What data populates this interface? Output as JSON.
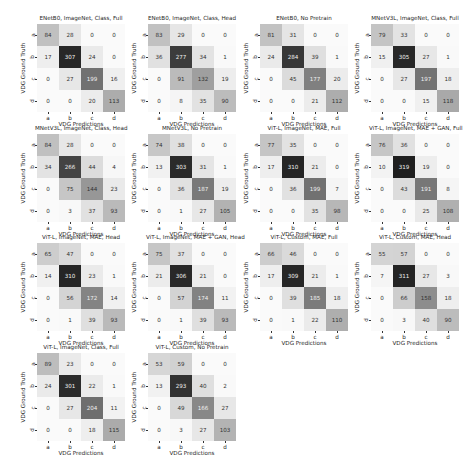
{
  "chart_data": [
    {
      "type": "heatmap",
      "title": "ENetB0, ImageNet, Class, Full",
      "xlabel": "VDG Predictions",
      "ylabel": "VDG Ground Truth",
      "x_ticks": [
        "a",
        "b",
        "c",
        "d"
      ],
      "y_ticks": [
        "a",
        "b",
        "c",
        "d"
      ],
      "matrix": [
        [
          84,
          28,
          0,
          0
        ],
        [
          17,
          307,
          24,
          0
        ],
        [
          0,
          27,
          199,
          16
        ],
        [
          0,
          0,
          20,
          113
        ]
      ]
    },
    {
      "type": "heatmap",
      "title": "ENetB0, ImageNet, Class, Head",
      "xlabel": "VDG Predictions",
      "ylabel": "VDG Ground Truth",
      "x_ticks": [
        "a",
        "b",
        "c",
        "d"
      ],
      "y_ticks": [
        "a",
        "b",
        "c",
        "d"
      ],
      "matrix": [
        [
          83,
          29,
          0,
          0
        ],
        [
          36,
          277,
          34,
          1
        ],
        [
          0,
          91,
          132,
          19
        ],
        [
          0,
          8,
          35,
          90
        ]
      ]
    },
    {
      "type": "heatmap",
      "title": "ENetB0, No Pretrain",
      "xlabel": "VDG Predictions",
      "ylabel": "VDG Ground Truth",
      "x_ticks": [
        "a",
        "b",
        "c",
        "d"
      ],
      "y_ticks": [
        "a",
        "b",
        "c",
        "d"
      ],
      "matrix": [
        [
          81,
          31,
          0,
          0
        ],
        [
          24,
          284,
          39,
          1
        ],
        [
          0,
          45,
          177,
          20
        ],
        [
          0,
          0,
          21,
          112
        ]
      ]
    },
    {
      "type": "heatmap",
      "title": "MNetV3L, ImageNet, Class, Full",
      "xlabel": "VDG Predictions",
      "ylabel": "VDG Ground Truth",
      "x_ticks": [
        "a",
        "b",
        "c",
        "d"
      ],
      "y_ticks": [
        "a",
        "b",
        "c",
        "d"
      ],
      "matrix": [
        [
          79,
          33,
          0,
          0
        ],
        [
          15,
          305,
          27,
          1
        ],
        [
          0,
          27,
          197,
          18
        ],
        [
          0,
          0,
          15,
          118
        ]
      ]
    },
    {
      "type": "heatmap",
      "title": "MNetV3L, ImageNet, Class, Head",
      "xlabel": "VDG Predictions",
      "ylabel": "VDG Ground Truth",
      "x_ticks": [
        "a",
        "b",
        "c",
        "d"
      ],
      "y_ticks": [
        "a",
        "b",
        "c",
        "d"
      ],
      "matrix": [
        [
          84,
          28,
          0,
          0
        ],
        [
          34,
          266,
          44,
          4
        ],
        [
          0,
          75,
          144,
          23
        ],
        [
          0,
          3,
          37,
          93
        ]
      ]
    },
    {
      "type": "heatmap",
      "title": "MNetV3L, No Pretrain",
      "xlabel": "VDG Predictions",
      "ylabel": "VDG Ground Truth",
      "x_ticks": [
        "a",
        "b",
        "c",
        "d"
      ],
      "y_ticks": [
        "a",
        "b",
        "c",
        "d"
      ],
      "matrix": [
        [
          74,
          38,
          0,
          0
        ],
        [
          13,
          303,
          31,
          1
        ],
        [
          0,
          36,
          187,
          19
        ],
        [
          0,
          1,
          27,
          105
        ]
      ]
    },
    {
      "type": "heatmap",
      "title": "ViT-L, ImageNet, MAE, Full",
      "xlabel": "VDG Predictions",
      "ylabel": "VDG Ground Truth",
      "x_ticks": [
        "a",
        "b",
        "c",
        "d"
      ],
      "y_ticks": [
        "a",
        "b",
        "c",
        "d"
      ],
      "matrix": [
        [
          77,
          35,
          0,
          0
        ],
        [
          17,
          310,
          21,
          0
        ],
        [
          0,
          36,
          199,
          7
        ],
        [
          0,
          0,
          35,
          98
        ]
      ]
    },
    {
      "type": "heatmap",
      "title": "ViT-L, ImageNet, MAE + GAN, Full",
      "xlabel": "VDG Predictions",
      "ylabel": "VDG Ground Truth",
      "x_ticks": [
        "a",
        "b",
        "c",
        "d"
      ],
      "y_ticks": [
        "a",
        "b",
        "c",
        "d"
      ],
      "matrix": [
        [
          76,
          36,
          0,
          0
        ],
        [
          10,
          319,
          19,
          0
        ],
        [
          0,
          43,
          191,
          8
        ],
        [
          0,
          0,
          25,
          108
        ]
      ]
    },
    {
      "type": "heatmap",
      "title": "ViT-L, ImageNet, MAE, Head",
      "xlabel": "VDG Predictions",
      "ylabel": "VDG Ground Truth",
      "x_ticks": [
        "a",
        "b",
        "c",
        "d"
      ],
      "y_ticks": [
        "a",
        "b",
        "c",
        "d"
      ],
      "matrix": [
        [
          65,
          47,
          0,
          0
        ],
        [
          14,
          310,
          23,
          1
        ],
        [
          0,
          56,
          172,
          14
        ],
        [
          0,
          1,
          39,
          93
        ]
      ]
    },
    {
      "type": "heatmap",
      "title": "ViT-L, ImageNet, MAE + GAN, Head",
      "xlabel": "VDG Predictions",
      "ylabel": "VDG Ground Truth",
      "x_ticks": [
        "a",
        "b",
        "c",
        "d"
      ],
      "y_ticks": [
        "a",
        "b",
        "c",
        "d"
      ],
      "matrix": [
        [
          75,
          37,
          0,
          0
        ],
        [
          21,
          306,
          21,
          0
        ],
        [
          0,
          57,
          174,
          11
        ],
        [
          0,
          1,
          39,
          93
        ]
      ]
    },
    {
      "type": "heatmap",
      "title": "ViT-L, Custom, MAE, Full",
      "xlabel": "VDG Predictions",
      "ylabel": "VDG Ground Truth",
      "x_ticks": [
        "a",
        "b",
        "c",
        "d"
      ],
      "y_ticks": [
        "a",
        "b",
        "c",
        "d"
      ],
      "matrix": [
        [
          66,
          46,
          0,
          0
        ],
        [
          17,
          309,
          21,
          1
        ],
        [
          0,
          39,
          185,
          18
        ],
        [
          0,
          1,
          22,
          110
        ]
      ]
    },
    {
      "type": "heatmap",
      "title": "ViT-L, Custom, MAE, Head",
      "xlabel": "VDG Predictions",
      "ylabel": "VDG Ground Truth",
      "x_ticks": [
        "a",
        "b",
        "c",
        "d"
      ],
      "y_ticks": [
        "a",
        "b",
        "c",
        "d"
      ],
      "matrix": [
        [
          55,
          57,
          0,
          0
        ],
        [
          7,
          311,
          27,
          3
        ],
        [
          0,
          66,
          158,
          18
        ],
        [
          0,
          3,
          40,
          90
        ]
      ]
    },
    {
      "type": "heatmap",
      "title": "ViT-L, ImageNet, Class, Full",
      "xlabel": "VDG Predictions",
      "ylabel": "VDG Ground Truth",
      "x_ticks": [
        "a",
        "b",
        "c",
        "d"
      ],
      "y_ticks": [
        "a",
        "b",
        "c",
        "d"
      ],
      "matrix": [
        [
          89,
          23,
          0,
          0
        ],
        [
          24,
          301,
          22,
          1
        ],
        [
          0,
          27,
          204,
          11
        ],
        [
          0,
          0,
          18,
          115
        ]
      ]
    },
    {
      "type": "heatmap",
      "title": "ViT-L, Custom, No Pretrain",
      "xlabel": "VDG Predictions",
      "ylabel": "VDG Ground Truth",
      "x_ticks": [
        "a",
        "b",
        "c",
        "d"
      ],
      "y_ticks": [
        "a",
        "b",
        "c",
        "d"
      ],
      "matrix": [
        [
          53,
          59,
          0,
          0
        ],
        [
          13,
          293,
          40,
          2
        ],
        [
          0,
          49,
          166,
          27
        ],
        [
          0,
          3,
          27,
          103
        ]
      ]
    }
  ],
  "layout": {
    "color_max": 320,
    "positions": [
      [
        17,
        15
      ],
      [
        128,
        15
      ],
      [
        240,
        15
      ],
      [
        351,
        15
      ],
      [
        17,
        125
      ],
      [
        128,
        125
      ],
      [
        240,
        125
      ],
      [
        351,
        125
      ],
      [
        17,
        234
      ],
      [
        128,
        234
      ],
      [
        240,
        234
      ],
      [
        351,
        234
      ],
      [
        17,
        344
      ],
      [
        128,
        344
      ]
    ]
  }
}
